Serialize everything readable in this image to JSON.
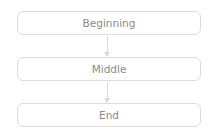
{
  "diagram": {
    "type": "flowchart",
    "direction": "top-to-bottom",
    "nodes": [
      {
        "id": "n1",
        "label": "Beginning"
      },
      {
        "id": "n2",
        "label": "Middle"
      },
      {
        "id": "n3",
        "label": "End"
      }
    ],
    "edges": [
      {
        "from": "n1",
        "to": "n2"
      },
      {
        "from": "n2",
        "to": "n3"
      }
    ],
    "colors": {
      "border": "#dcdcdc",
      "text": "#8a8a8a",
      "arrow": "#dadada",
      "background": "#ffffff"
    }
  }
}
